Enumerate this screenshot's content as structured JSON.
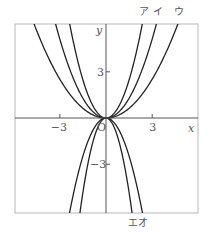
{
  "chart_data": {
    "type": "line",
    "title": "",
    "xlabel": "x",
    "ylabel": "y",
    "origin_label": "O",
    "xlim": [
      -5.9,
      6.0
    ],
    "ylim": [
      -6.2,
      6.1
    ],
    "grid": false,
    "x_ticks": [
      {
        "value": -3,
        "label": "−3"
      },
      {
        "value": 3,
        "label": "3"
      }
    ],
    "y_ticks": [
      {
        "value": 3,
        "label": "3"
      },
      {
        "value": -3,
        "label": "−3"
      }
    ],
    "series": [
      {
        "name": "ア",
        "formula": "y = a x^2",
        "a": 1.1,
        "label_position": "top-right"
      },
      {
        "name": "イ",
        "formula": "y = a x^2",
        "a": 0.57,
        "label_position": "top-right"
      },
      {
        "name": "ウ",
        "formula": "y = a x^2",
        "a": 0.28,
        "label_position": "top-right"
      },
      {
        "name": "エ",
        "formula": "y = a x^2",
        "a": -2.15,
        "label_position": "bottom-right"
      },
      {
        "name": "オ",
        "formula": "y = a x^2",
        "a": -1.1,
        "label_position": "bottom-right"
      }
    ]
  },
  "colors": {
    "curve": "#222222",
    "axis": "#555555",
    "frame": "#b8b8b8",
    "text": "#555555"
  }
}
